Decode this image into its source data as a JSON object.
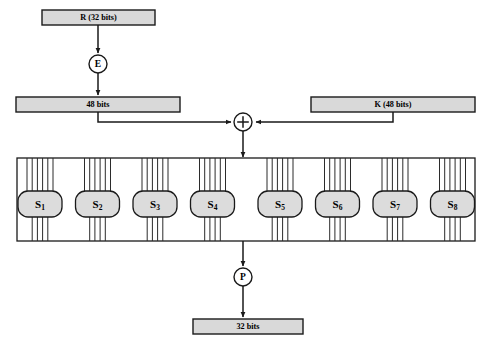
{
  "diagram": {
    "width": 491,
    "height": 356,
    "background": "#ffffff",
    "stroke_color": "#1a1a1a",
    "box_fill": "#d9d9d9",
    "sbox_fill": "#dcdcdc",
    "circle_fill": "#ffffff"
  },
  "nodes": {
    "input_r": {
      "label": "R (32 bits)",
      "shape": "rect",
      "x": 42,
      "y": 10,
      "w": 113,
      "h": 15
    },
    "expansion": {
      "label": "E",
      "shape": "circle",
      "cx": 98,
      "cy": 64,
      "r": 9
    },
    "expanded": {
      "label": "48 bits",
      "shape": "rect",
      "x": 16,
      "y": 97,
      "w": 164,
      "h": 15
    },
    "subkey": {
      "label": "K (48 bits)",
      "shape": "rect",
      "x": 311,
      "y": 97,
      "w": 164,
      "h": 15
    },
    "xor": {
      "label": "+",
      "shape": "circle",
      "cx": 243,
      "cy": 122,
      "r": 9
    },
    "permutation": {
      "label": "P",
      "shape": "circle",
      "cx": 243,
      "cy": 277,
      "r": 9
    },
    "output": {
      "label": "32 bits",
      "shape": "rect",
      "x": 193,
      "y": 319,
      "w": 110,
      "h": 15
    }
  },
  "sbox_group": {
    "container": {
      "x": 17,
      "y": 158,
      "w": 458,
      "h": 83
    },
    "sbox_width": 44,
    "sbox_height": 26,
    "sbox_y": 191,
    "inputs_per_sbox": 6,
    "outputs_per_sbox": 4,
    "input_line_spacing": 5.2,
    "output_line_spacing": 5.2,
    "boxes": [
      {
        "letter": "S",
        "index": "1",
        "label": "S1",
        "cx": 40
      },
      {
        "letter": "S",
        "index": "2",
        "label": "S2",
        "cx": 97.5
      },
      {
        "letter": "S",
        "index": "3",
        "label": "S3",
        "cx": 155
      },
      {
        "letter": "S",
        "index": "4",
        "label": "S4",
        "cx": 212.5
      },
      {
        "letter": "S",
        "index": "5",
        "label": "S5",
        "cx": 280
      },
      {
        "letter": "S",
        "index": "6",
        "label": "S6",
        "cx": 337.5
      },
      {
        "letter": "S",
        "index": "7",
        "label": "S7",
        "cx": 395
      },
      {
        "letter": "S",
        "index": "8",
        "label": "S8",
        "cx": 452.5
      }
    ]
  },
  "edges": [
    {
      "name": "r-to-e",
      "from": "input_r",
      "to": "expansion",
      "arrow": true
    },
    {
      "name": "e-to-48bits",
      "from": "expansion",
      "to": "expanded",
      "arrow": true
    },
    {
      "name": "48bits-to-xor",
      "from": "expanded",
      "to": "xor",
      "arrow": true
    },
    {
      "name": "k-to-xor",
      "from": "subkey",
      "to": "xor",
      "arrow": true
    },
    {
      "name": "xor-to-sboxes",
      "from": "xor",
      "to": "sbox_group",
      "arrow": true
    },
    {
      "name": "sboxes-to-p",
      "from": "sbox_group",
      "to": "permutation",
      "arrow": true
    },
    {
      "name": "p-to-output",
      "from": "permutation",
      "to": "output",
      "arrow": true
    }
  ]
}
